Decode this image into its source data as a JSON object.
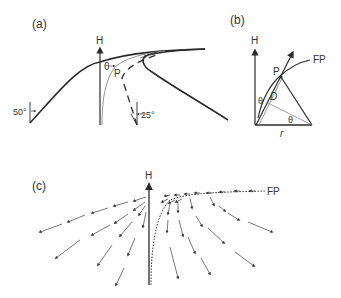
{
  "figure": {
    "panel_a": {
      "label": "(a)",
      "axis_label": "H",
      "point_label": "P",
      "angle_symbol": "θ",
      "left_angle": "50°",
      "right_angle": "25°"
    },
    "panel_b": {
      "label": "(b)",
      "axis_label": "H",
      "point_label": "P",
      "curve_label": "FP",
      "distance_label": "D",
      "angle_symbol_1": "θ",
      "angle_symbol_2": "θ",
      "radius_label": "r"
    },
    "panel_c": {
      "label": "(c)",
      "axis_label": "H",
      "curve_label": "FP"
    }
  },
  "colors": {
    "line": "#2a2a2a",
    "thin_line": "#777777",
    "background": "#ffffff"
  }
}
